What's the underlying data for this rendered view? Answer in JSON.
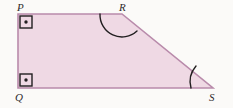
{
  "figure": {
    "shape_type": "quadrilateral",
    "background_color": "#fbfaf8",
    "fill_color": "#efd9e4",
    "stroke_color": "#b98bab",
    "mark_color": "#221f20",
    "vertices": [
      {
        "name": "P",
        "label": "P",
        "x": 18,
        "y": 14,
        "label_x": 17,
        "label_y": 2,
        "angle_mark": "right-angle-square-dot"
      },
      {
        "name": "R",
        "label": "R",
        "x": 122,
        "y": 14,
        "label_x": 119,
        "label_y": 2,
        "angle_mark": "single-arc"
      },
      {
        "name": "S",
        "label": "S",
        "x": 213,
        "y": 88,
        "label_x": 209,
        "label_y": 92,
        "angle_mark": "single-arc"
      },
      {
        "name": "Q",
        "label": "Q",
        "x": 18,
        "y": 88,
        "label_x": 15,
        "label_y": 92,
        "angle_mark": "right-angle-square-dot"
      }
    ],
    "polygon_points": "18,14 122,14 213,88 18,88",
    "edges": [
      {
        "name": "PR",
        "from": "P",
        "to": "R"
      },
      {
        "name": "RS",
        "from": "R",
        "to": "S"
      },
      {
        "name": "SQ",
        "from": "S",
        "to": "Q"
      },
      {
        "name": "QP",
        "from": "Q",
        "to": "P"
      }
    ],
    "right_angle_squares": [
      {
        "at": "P",
        "x": 20,
        "y": 16,
        "size": 12,
        "dot_x": 26,
        "dot_y": 22
      },
      {
        "at": "Q",
        "x": 20,
        "y": 74,
        "size": 12,
        "dot_x": 26,
        "dot_y": 80
      }
    ],
    "angle_arcs": [
      {
        "at": "R",
        "path": "M 100 14 A 22 22 0 0 0 137 31"
      },
      {
        "at": "S",
        "path": "M 196 66 A 24 24 0 0 0 191 88"
      }
    ]
  }
}
